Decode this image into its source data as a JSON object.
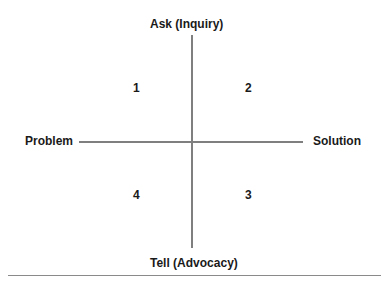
{
  "diagram": {
    "type": "quadrant",
    "axes": {
      "top": "Ask (Inquiry)",
      "bottom": "Tell (Advocacy)",
      "left": "Problem",
      "right": "Solution"
    },
    "quadrants": [
      {
        "position": "top-left",
        "label": "1"
      },
      {
        "position": "top-right",
        "label": "2"
      },
      {
        "position": "bottom-right",
        "label": "3"
      },
      {
        "position": "bottom-left",
        "label": "4"
      }
    ],
    "colors": {
      "axis_line": "#7f7f7f",
      "text": "#1a1a1a"
    }
  }
}
